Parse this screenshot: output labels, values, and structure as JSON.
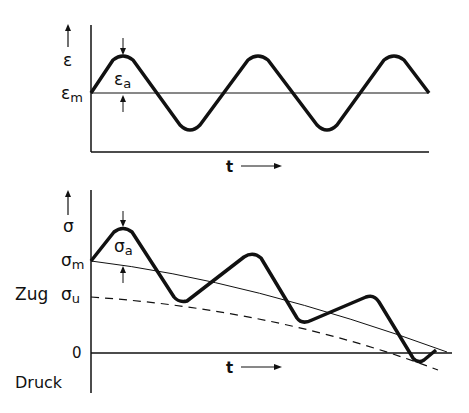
{
  "top_chart": {
    "y_symbol": "ε",
    "mean_label": "ε",
    "mean_sub": "m",
    "amp_label": "ε",
    "amp_sub": "a",
    "x_label": "t"
  },
  "bottom_chart": {
    "y_symbol": "σ",
    "mean_label": "σ",
    "mean_sub": "m",
    "amp_label": "σ",
    "amp_sub": "a",
    "lower_label": "σ",
    "lower_sub": "u",
    "zero_label": "0",
    "tension_label": "Zug",
    "compression_label": "Druck",
    "x_label": "t"
  },
  "colors": {
    "ink": "#111111",
    "background": "#ffffff"
  }
}
